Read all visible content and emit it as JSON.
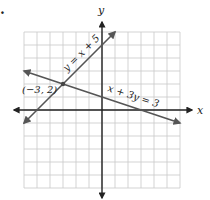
{
  "chart_data": {
    "type": "line",
    "title": "",
    "xlabel": "x",
    "ylabel": "y",
    "xlim": [
      -6,
      6
    ],
    "ylim": [
      -6,
      6
    ],
    "grid": true,
    "series": [
      {
        "name": "y = x + 5",
        "points": [
          [
            -6,
            -1
          ],
          [
            1,
            6
          ]
        ],
        "color": "#555555"
      },
      {
        "name": "x + 3y = 3",
        "points": [
          [
            -6,
            3
          ],
          [
            6,
            -1
          ]
        ],
        "color": "#555555"
      }
    ],
    "annotations": [
      {
        "text": "(−3, 2)",
        "point": [
          -3,
          2
        ]
      }
    ]
  },
  "labels": {
    "x_axis": "x",
    "y_axis": "y",
    "line1": "y = x + 5",
    "line2": "x + 3y = 3",
    "intersection": "(−3, 2)",
    "bullet": "."
  }
}
